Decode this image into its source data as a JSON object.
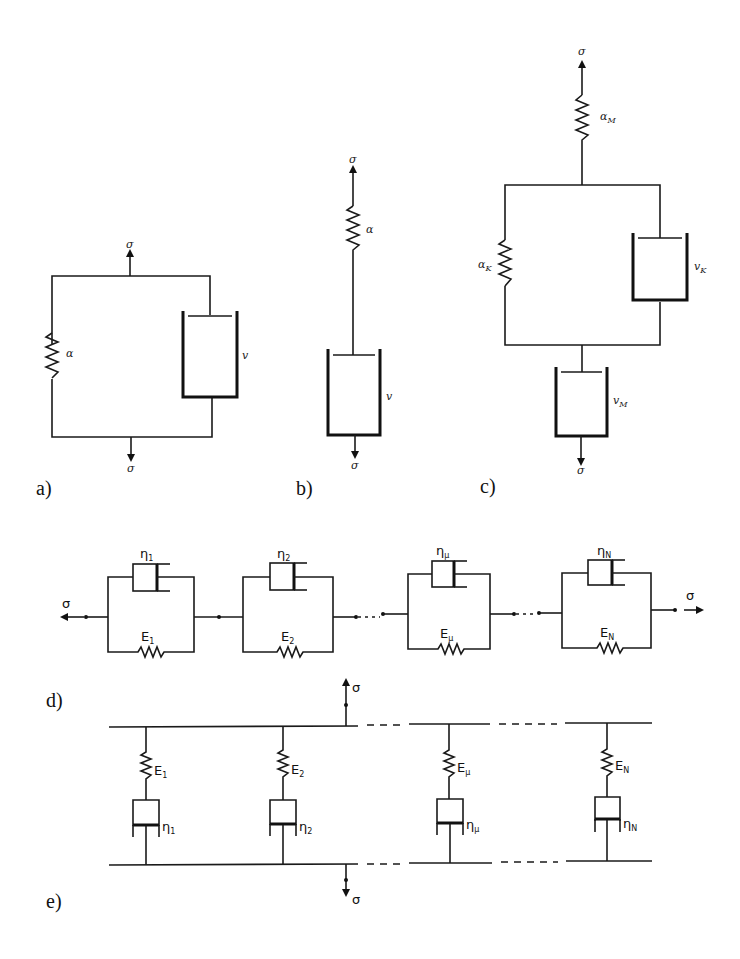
{
  "figure": {
    "panels": [
      {
        "id": "a",
        "label": "a)",
        "type": "parallel spring-dashpot (Kelvin-Voigt)",
        "elements": {
          "spring": "α",
          "dashpot": "v"
        },
        "load_top": "σ",
        "load_bottom": "σ"
      },
      {
        "id": "b",
        "label": "b)",
        "type": "series spring-dashpot (Maxwell)",
        "elements": {
          "spring": "α",
          "dashpot": "v"
        },
        "load_top": "σ",
        "load_bottom": "σ"
      },
      {
        "id": "c",
        "label": "c)",
        "type": "Burgers model",
        "elements": {
          "spring_m": {
            "sym": "α",
            "sub": "M"
          },
          "spring_k": {
            "sym": "α",
            "sub": "K"
          },
          "dashpot_k": {
            "sym": "v",
            "sub": "K"
          },
          "dashpot_m": {
            "sym": "v",
            "sub": "M"
          }
        },
        "load_top": "σ",
        "load_bottom": "σ"
      },
      {
        "id": "d",
        "label": "d)",
        "type": "generalized Kelvin chain",
        "load_left": "σ",
        "load_right": "σ",
        "units": [
          {
            "eta": "η",
            "eta_sub": "1",
            "E": "E",
            "E_sub": "1"
          },
          {
            "eta": "η",
            "eta_sub": "2",
            "E": "E",
            "E_sub": "2"
          },
          {
            "eta": "η",
            "eta_sub": "μ",
            "E": "E",
            "E_sub": "μ"
          },
          {
            "eta": "η",
            "eta_sub": "N",
            "E": "E",
            "E_sub": "N"
          }
        ]
      },
      {
        "id": "e",
        "label": "e)",
        "type": "generalized Maxwell model",
        "load_top": "σ",
        "load_bottom": "σ",
        "units": [
          {
            "E": "E",
            "E_sub": "1",
            "eta": "η",
            "eta_sub": "1"
          },
          {
            "E": "E",
            "E_sub": "2",
            "eta": "η",
            "eta_sub": "2"
          },
          {
            "E": "E",
            "E_sub": "μ",
            "eta": "η",
            "eta_sub": "μ"
          },
          {
            "E": "E",
            "E_sub": "N",
            "eta": "η",
            "eta_sub": "N"
          }
        ]
      }
    ]
  }
}
